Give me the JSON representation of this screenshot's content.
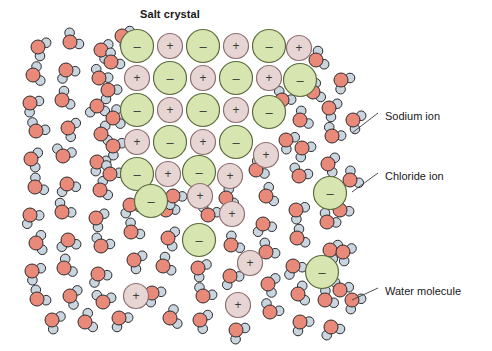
{
  "figure": {
    "title": "Salt crystal",
    "kind": "science-diagram"
  },
  "colors": {
    "chloride_fill": "#d7e5b0",
    "chloride_stroke": "#5d6b3f",
    "sodium_fill": "#e7d5d4",
    "sodium_stroke": "#8e6f70",
    "oxygen_fill": "#e8897a",
    "oxygen_stroke": "#2d2a2b",
    "hydrogen_fill": "#c9d6e0",
    "hydrogen_stroke": "#2d2a2b",
    "leader_line": "#3d3a3b",
    "text": "#19181a",
    "background": "#ffffff"
  },
  "symbols": {
    "anion_charge": "–",
    "cation_charge": "+"
  },
  "callouts": [
    {
      "id": "sodium",
      "text": "Sodium ion",
      "x": 385,
      "y": 110,
      "leader": [
        352,
        133,
        378,
        113
      ]
    },
    {
      "id": "chloride",
      "text": "Chloride ion",
      "x": 385,
      "y": 170,
      "leader": [
        352,
        192,
        378,
        173
      ]
    },
    {
      "id": "water",
      "text": "Water molecule",
      "x": 385,
      "y": 285,
      "leader": [
        352,
        300,
        378,
        288
      ]
    }
  ],
  "lattice": {
    "description": "Ordered alternating grid of chloride and sodium ions forming the crystal, eroding toward the lower-right into solution.",
    "chloride_radius": 16.5,
    "sodium_radius": 12.5,
    "ions": [
      {
        "t": "cl",
        "x": 137,
        "y": 46
      },
      {
        "t": "na",
        "x": 170,
        "y": 46
      },
      {
        "t": "cl",
        "x": 203,
        "y": 46
      },
      {
        "t": "na",
        "x": 236,
        "y": 46
      },
      {
        "t": "cl",
        "x": 269,
        "y": 46
      },
      {
        "t": "na",
        "x": 299,
        "y": 48
      },
      {
        "t": "na",
        "x": 137,
        "y": 78
      },
      {
        "t": "cl",
        "x": 170,
        "y": 78
      },
      {
        "t": "na",
        "x": 203,
        "y": 78
      },
      {
        "t": "cl",
        "x": 236,
        "y": 78
      },
      {
        "t": "na",
        "x": 269,
        "y": 78
      },
      {
        "t": "cl",
        "x": 300,
        "y": 80
      },
      {
        "t": "cl",
        "x": 137,
        "y": 110
      },
      {
        "t": "na",
        "x": 170,
        "y": 110
      },
      {
        "t": "cl",
        "x": 203,
        "y": 110
      },
      {
        "t": "na",
        "x": 236,
        "y": 110
      },
      {
        "t": "cl",
        "x": 269,
        "y": 112
      },
      {
        "t": "na",
        "x": 137,
        "y": 142
      },
      {
        "t": "cl",
        "x": 170,
        "y": 142
      },
      {
        "t": "na",
        "x": 203,
        "y": 142
      },
      {
        "t": "cl",
        "x": 236,
        "y": 142
      },
      {
        "t": "na",
        "x": 266,
        "y": 155
      },
      {
        "t": "cl",
        "x": 137,
        "y": 174
      },
      {
        "t": "na",
        "x": 168,
        "y": 174
      },
      {
        "t": "cl",
        "x": 199,
        "y": 172
      },
      {
        "t": "na",
        "x": 230,
        "y": 176
      },
      {
        "t": "cl",
        "x": 151,
        "y": 201
      },
      {
        "t": "na",
        "x": 200,
        "y": 196
      },
      {
        "t": "na",
        "x": 232,
        "y": 214
      },
      {
        "t": "cl",
        "x": 199,
        "y": 240
      },
      {
        "t": "na",
        "x": 250,
        "y": 263
      },
      {
        "t": "cl",
        "x": 330,
        "y": 193
      },
      {
        "t": "cl",
        "x": 322,
        "y": 272
      },
      {
        "t": "na",
        "x": 136,
        "y": 296
      },
      {
        "t": "na",
        "x": 238,
        "y": 305
      }
    ]
  },
  "water": {
    "description": "Free water molecules filling the solvent, each a salmon oxygen with two pale-blue hydrogens.",
    "oxygen_radius": 7.0,
    "hydrogen_radius": 4.8,
    "bond_length": 9.2,
    "molecules": [
      {
        "x": 38,
        "y": 47,
        "r": 25
      },
      {
        "x": 70,
        "y": 42,
        "r": -40
      },
      {
        "x": 101,
        "y": 50,
        "r": 15
      },
      {
        "x": 33,
        "y": 75,
        "r": -15
      },
      {
        "x": 66,
        "y": 70,
        "r": 60
      },
      {
        "x": 99,
        "y": 78,
        "r": -55
      },
      {
        "x": 30,
        "y": 103,
        "r": 40
      },
      {
        "x": 62,
        "y": 100,
        "r": -25
      },
      {
        "x": 97,
        "y": 106,
        "r": 85
      },
      {
        "x": 36,
        "y": 131,
        "r": -60
      },
      {
        "x": 68,
        "y": 128,
        "r": 20
      },
      {
        "x": 101,
        "y": 134,
        "r": -10
      },
      {
        "x": 31,
        "y": 159,
        "r": 10
      },
      {
        "x": 63,
        "y": 156,
        "r": -75
      },
      {
        "x": 97,
        "y": 162,
        "r": 45
      },
      {
        "x": 35,
        "y": 187,
        "r": -35
      },
      {
        "x": 67,
        "y": 184,
        "r": 70
      },
      {
        "x": 100,
        "y": 190,
        "r": -20
      },
      {
        "x": 30,
        "y": 215,
        "r": 55
      },
      {
        "x": 62,
        "y": 212,
        "r": -50
      },
      {
        "x": 96,
        "y": 218,
        "r": 25
      },
      {
        "x": 36,
        "y": 243,
        "r": -5
      },
      {
        "x": 68,
        "y": 240,
        "r": 80
      },
      {
        "x": 101,
        "y": 246,
        "r": -65
      },
      {
        "x": 32,
        "y": 271,
        "r": 35
      },
      {
        "x": 64,
        "y": 268,
        "r": -30
      },
      {
        "x": 98,
        "y": 274,
        "r": 60
      },
      {
        "x": 37,
        "y": 299,
        "r": -45
      },
      {
        "x": 70,
        "y": 296,
        "r": 15
      },
      {
        "x": 103,
        "y": 302,
        "r": -80
      },
      {
        "x": 52,
        "y": 320,
        "r": 30
      },
      {
        "x": 85,
        "y": 322,
        "r": -20
      },
      {
        "x": 119,
        "y": 318,
        "r": 50
      },
      {
        "x": 131,
        "y": 232,
        "r": -40
      },
      {
        "x": 134,
        "y": 260,
        "r": 25
      },
      {
        "x": 130,
        "y": 205,
        "r": 65
      },
      {
        "x": 166,
        "y": 210,
        "r": -55
      },
      {
        "x": 168,
        "y": 238,
        "r": 10
      },
      {
        "x": 163,
        "y": 266,
        "r": -25
      },
      {
        "x": 152,
        "y": 293,
        "r": 45
      },
      {
        "x": 170,
        "y": 318,
        "r": -15
      },
      {
        "x": 198,
        "y": 268,
        "r": 30
      },
      {
        "x": 203,
        "y": 296,
        "r": -60
      },
      {
        "x": 200,
        "y": 320,
        "r": 20
      },
      {
        "x": 231,
        "y": 245,
        "r": -35
      },
      {
        "x": 230,
        "y": 276,
        "r": 55
      },
      {
        "x": 208,
        "y": 215,
        "r": -70
      },
      {
        "x": 236,
        "y": 330,
        "r": 40
      },
      {
        "x": 266,
        "y": 196,
        "r": -20
      },
      {
        "x": 263,
        "y": 224,
        "r": 70
      },
      {
        "x": 266,
        "y": 252,
        "r": -45
      },
      {
        "x": 268,
        "y": 284,
        "r": 15
      },
      {
        "x": 270,
        "y": 312,
        "r": -60
      },
      {
        "x": 296,
        "y": 210,
        "r": 35
      },
      {
        "x": 297,
        "y": 238,
        "r": -25
      },
      {
        "x": 293,
        "y": 266,
        "r": 60
      },
      {
        "x": 298,
        "y": 294,
        "r": -10
      },
      {
        "x": 300,
        "y": 322,
        "r": 50
      },
      {
        "x": 327,
        "y": 222,
        "r": -50
      },
      {
        "x": 330,
        "y": 250,
        "r": 20
      },
      {
        "x": 325,
        "y": 300,
        "r": -35
      },
      {
        "x": 331,
        "y": 327,
        "r": 65
      },
      {
        "x": 300,
        "y": 120,
        "r": -30
      },
      {
        "x": 302,
        "y": 148,
        "r": 45
      },
      {
        "x": 299,
        "y": 176,
        "r": -65
      },
      {
        "x": 329,
        "y": 108,
        "r": 25
      },
      {
        "x": 332,
        "y": 136,
        "r": -55
      },
      {
        "x": 328,
        "y": 164,
        "r": 10
      },
      {
        "x": 313,
        "y": 92,
        "r": -20
      },
      {
        "x": 341,
        "y": 80,
        "r": 40
      },
      {
        "x": 340,
        "y": 210,
        "r": -45
      },
      {
        "x": 343,
        "y": 252,
        "r": 30
      },
      {
        "x": 340,
        "y": 290,
        "r": -70
      },
      {
        "x": 111,
        "y": 62,
        "r": -40
      },
      {
        "x": 108,
        "y": 90,
        "r": 50
      },
      {
        "x": 113,
        "y": 118,
        "r": -15
      },
      {
        "x": 113,
        "y": 146,
        "r": 35
      },
      {
        "x": 110,
        "y": 174,
        "r": -60
      },
      {
        "x": 122,
        "y": 36,
        "r": 20
      },
      {
        "x": 256,
        "y": 170,
        "r": -30
      },
      {
        "x": 173,
        "y": 196,
        "r": 55
      },
      {
        "x": 226,
        "y": 198,
        "r": -20
      },
      {
        "x": 286,
        "y": 140,
        "r": 35
      },
      {
        "x": 282,
        "y": 100,
        "r": -55
      },
      {
        "x": 353,
        "y": 120,
        "r": 25
      },
      {
        "x": 350,
        "y": 180,
        "r": -35
      },
      {
        "x": 352,
        "y": 300,
        "r": 45
      },
      {
        "x": 316,
        "y": 60,
        "r": -25
      }
    ]
  }
}
